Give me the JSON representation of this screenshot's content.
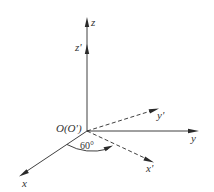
{
  "diagram": {
    "type": "3d-coordinate-axes",
    "origin_label": "O(O')",
    "angle_label": "60°",
    "axes": {
      "z": {
        "label": "z",
        "style": "solid"
      },
      "z_prime": {
        "label": "z'",
        "style": "solid-overlap"
      },
      "y": {
        "label": "y",
        "style": "solid"
      },
      "y_prime": {
        "label": "y'",
        "style": "dashed"
      },
      "x": {
        "label": "x",
        "style": "solid"
      },
      "x_prime": {
        "label": "x'",
        "style": "dashed"
      }
    },
    "colors": {
      "line": "#2a2a2a",
      "text": "#333333",
      "background": "#ffffff"
    }
  }
}
